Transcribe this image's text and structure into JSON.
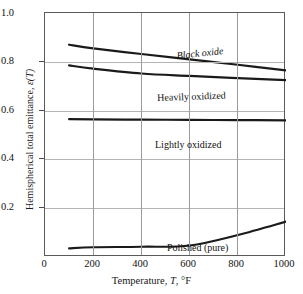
{
  "chart_data": {
    "type": "line",
    "title": "",
    "xlabel": "Temperature, T, °F",
    "ylabel": "Hemispherical total emittance, ε(T)",
    "xlim": [
      0,
      1000
    ],
    "ylim": [
      0.0,
      1.0
    ],
    "xticks": [
      "0",
      "200",
      "400",
      "600",
      "800",
      "1000"
    ],
    "yticks": [
      "0.2",
      "0.4",
      "0.6",
      "0.8",
      "1.0"
    ],
    "grid": "both",
    "legend_position": "inline-annotations",
    "series": [
      {
        "name": "Black oxide",
        "x": [
          100,
          200,
          400,
          600,
          800,
          1000
        ],
        "values": [
          0.87,
          0.855,
          0.832,
          0.81,
          0.788,
          0.765
        ]
      },
      {
        "name": "Heavily oxidized",
        "x": [
          100,
          200,
          400,
          600,
          800,
          1000
        ],
        "values": [
          0.785,
          0.772,
          0.752,
          0.742,
          0.733,
          0.725
        ]
      },
      {
        "name": "Lightly oxidized",
        "x": [
          100,
          200,
          400,
          600,
          800,
          1000
        ],
        "values": [
          0.565,
          0.564,
          0.563,
          0.562,
          0.561,
          0.56
        ]
      },
      {
        "name": "Polished (pure)",
        "x": [
          100,
          200,
          400,
          600,
          800,
          1000
        ],
        "values": [
          0.035,
          0.04,
          0.042,
          0.047,
          0.09,
          0.145
        ]
      }
    ]
  },
  "axes": {
    "x_title_main": "Temperature,",
    "x_title_symbol": "T",
    "x_title_unit": ", °F",
    "y_title_main": "Hemispherical total emittance,",
    "y_title_symbol": "ε(T)"
  },
  "colors": {
    "curve": "#1a1a1a",
    "grid_horizontal": "#b4b4b4",
    "grid_vertical": "#9a9a9a",
    "frame": "#5a5a5a",
    "background": "#ffffff",
    "text": "#111111"
  }
}
